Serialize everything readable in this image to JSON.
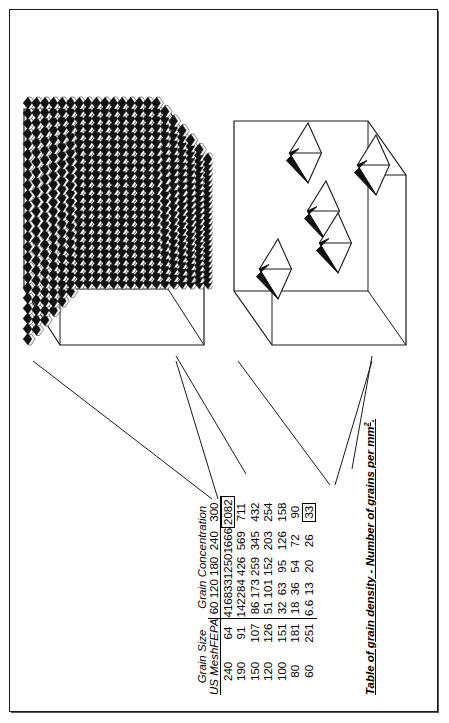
{
  "document": {
    "caption": "Table of grain density - Number of grains per mm",
    "caption_superscript": "2"
  },
  "table": {
    "group_headers": [
      {
        "label": "Grain Size",
        "span": 2
      },
      {
        "label": "Grain Concentration",
        "span": 5
      }
    ],
    "size_headers": [
      "US Mesh",
      "FEPA"
    ],
    "concentration_headers": [
      "60",
      "120",
      "180",
      "240",
      "300"
    ],
    "rows": [
      {
        "us_mesh": "240",
        "fepa": "64",
        "values": [
          "416",
          "833",
          "1250",
          "1666",
          "2082"
        ],
        "highlight": "2082"
      },
      {
        "us_mesh": "190",
        "fepa": "91",
        "values": [
          "142",
          "284",
          "426",
          "569",
          "711"
        ]
      },
      {
        "us_mesh": "150",
        "fepa": "107",
        "values": [
          "86",
          "173",
          "259",
          "345",
          "432"
        ]
      },
      {
        "us_mesh": "120",
        "fepa": "126",
        "values": [
          "51",
          "101",
          "152",
          "203",
          "254"
        ]
      },
      {
        "us_mesh": "100",
        "fepa": "151",
        "values": [
          "32",
          "63",
          "95",
          "126",
          "158"
        ]
      },
      {
        "us_mesh": "80",
        "fepa": "181",
        "values": [
          "18",
          "36",
          "54",
          "72",
          "90"
        ]
      },
      {
        "us_mesh": "60",
        "fepa": "251",
        "values": [
          "6.6",
          "13",
          "20",
          "26",
          "33"
        ],
        "highlight": "33"
      }
    ]
  },
  "illustrations": [
    {
      "name": "dense-grain-cube",
      "description": "Cube showing densely packed abrasive grains",
      "linked_value": "2082"
    },
    {
      "name": "sparse-grain-cube",
      "description": "Cube showing sparsely distributed abrasive grains",
      "linked_value": "33"
    }
  ],
  "chart_data": {
    "type": "table",
    "xlabel": "Grain Concentration",
    "ylabel": "Grain Size",
    "categories": [
      "60",
      "120",
      "180",
      "240",
      "300"
    ],
    "row_keys": [
      {
        "us_mesh": "240",
        "fepa": "64"
      },
      {
        "us_mesh": "190",
        "fepa": "91"
      },
      {
        "us_mesh": "150",
        "fepa": "107"
      },
      {
        "us_mesh": "120",
        "fepa": "126"
      },
      {
        "us_mesh": "100",
        "fepa": "151"
      },
      {
        "us_mesh": "80",
        "fepa": "181"
      },
      {
        "us_mesh": "60",
        "fepa": "251"
      }
    ],
    "series": [
      {
        "name": "240 US Mesh / 64 FEPA",
        "values": [
          416,
          833,
          1250,
          1666,
          2082
        ]
      },
      {
        "name": "190 US Mesh / 91 FEPA",
        "values": [
          142,
          284,
          426,
          569,
          711
        ]
      },
      {
        "name": "150 US Mesh / 107 FEPA",
        "values": [
          86,
          173,
          259,
          345,
          432
        ]
      },
      {
        "name": "120 US Mesh / 126 FEPA",
        "values": [
          51,
          101,
          152,
          203,
          254
        ]
      },
      {
        "name": "100 US Mesh / 151 FEPA",
        "values": [
          32,
          63,
          95,
          126,
          158
        ]
      },
      {
        "name": "80 US Mesh / 181 FEPA",
        "values": [
          18,
          36,
          54,
          72,
          90
        ]
      },
      {
        "name": "60 US Mesh / 251 FEPA",
        "values": [
          6.6,
          13,
          20,
          26,
          33
        ]
      }
    ],
    "annotations": [
      {
        "value": 2082,
        "note": "dense grain cube illustration"
      },
      {
        "value": 33,
        "note": "sparse grain cube illustration"
      }
    ],
    "grid": false,
    "legend": "none"
  }
}
